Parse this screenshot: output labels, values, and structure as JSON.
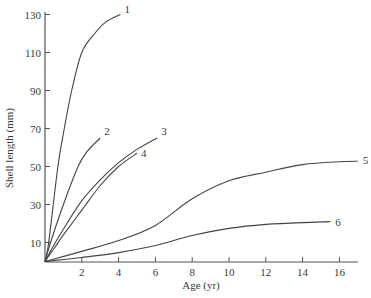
{
  "chart_data": {
    "type": "line",
    "title": "",
    "xlabel": "Age (yr)",
    "ylabel": "Shell length (mm)",
    "xlim": [
      0,
      17.2
    ],
    "ylim": [
      0,
      133
    ],
    "x_ticks": [
      2,
      4,
      6,
      8,
      10,
      12,
      14,
      16
    ],
    "y_ticks": [
      10,
      30,
      50,
      70,
      90,
      110,
      130
    ],
    "grid": false,
    "legend": "none (curves labelled 1-6 at their ends)",
    "series": [
      {
        "name": "1",
        "x": [
          0,
          0.2,
          0.7,
          1.05,
          1.45,
          2.0,
          2.7,
          3.3,
          4.1
        ],
        "y": [
          0,
          10,
          50,
          70,
          90,
          110,
          120,
          126,
          130
        ]
      },
      {
        "name": "2",
        "x": [
          0,
          0.3,
          1.0,
          1.8,
          2.3,
          3.0
        ],
        "y": [
          0,
          10,
          30,
          50,
          58,
          65
        ]
      },
      {
        "name": "3",
        "x": [
          0,
          0.5,
          1.0,
          2.0,
          3.0,
          4.0,
          5.0,
          6.1
        ],
        "y": [
          0,
          9,
          17,
          32,
          43,
          52,
          59,
          65
        ]
      },
      {
        "name": "4",
        "x": [
          0,
          0.5,
          1.0,
          2.0,
          3.0,
          4.0,
          5.0
        ],
        "y": [
          0,
          7,
          14,
          27,
          40,
          50,
          57
        ]
      },
      {
        "name": "5",
        "x": [
          0,
          2,
          4,
          6,
          8,
          10,
          12,
          14,
          16,
          17
        ],
        "y": [
          0,
          5.3,
          11,
          19,
          33,
          42.5,
          47,
          51,
          52.5,
          52.8
        ]
      },
      {
        "name": "6",
        "x": [
          0,
          2,
          4,
          6,
          8,
          10,
          12,
          14,
          15.5
        ],
        "y": [
          0,
          2.1,
          4.7,
          8.4,
          13.7,
          17.4,
          19.5,
          20.5,
          21
        ]
      }
    ]
  },
  "labels": {
    "xlabel": "Age (yr)",
    "ylabel": "Shell length (mm)",
    "x_ticks": [
      "2",
      "4",
      "6",
      "8",
      "10",
      "12",
      "14",
      "16"
    ],
    "y_ticks": [
      "10",
      "30",
      "50",
      "70",
      "90",
      "110",
      "130"
    ],
    "curves": [
      "1",
      "2",
      "3",
      "4",
      "5",
      "6"
    ]
  },
  "colors": {
    "line": "#444444",
    "text": "#3a3a3a",
    "background": "#ffffff"
  }
}
